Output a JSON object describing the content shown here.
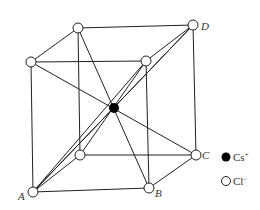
{
  "figure": {
    "vertex_labels": {
      "A": "A",
      "B": "B",
      "C": "C",
      "D": "D"
    },
    "center_atom": "Cs+",
    "corner_atom": "Cl-"
  },
  "legend": {
    "items": [
      {
        "symbol": "filled-circle",
        "label": "Cs",
        "superscript": "+",
        "color": "#000000"
      },
      {
        "symbol": "open-circle",
        "label": "Cl",
        "superscript": "-",
        "color": "#ffffff"
      }
    ]
  },
  "colors": {
    "line": "#222222",
    "filled": "#000000",
    "open": "#ffffff"
  }
}
